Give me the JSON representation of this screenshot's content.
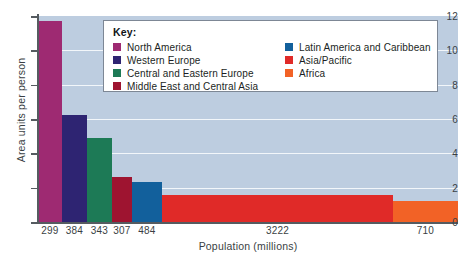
{
  "chart_data": {
    "type": "bar",
    "title": "",
    "xlabel": "Population (millions)",
    "ylabel": "Area units per person",
    "ylim": [
      0,
      12
    ],
    "ytick_values": [
      0,
      2,
      4,
      6,
      8,
      10,
      12
    ],
    "ytick_labels": [
      "0",
      "2",
      "4",
      "6",
      "8",
      "10",
      "12"
    ],
    "grid": true,
    "grid_color": "#f2f6fa",
    "plot_background": "#bdcde0",
    "legend_position": "top-center",
    "note": "Bar widths are proportional to population (millions); bar heights are area units per person.",
    "categories": [
      "North America",
      "Western Europe",
      "Central and Eastern Europe",
      "Middle East and Central Asia",
      "Latin America and Caribbean",
      "Asia/Pacific",
      "Africa"
    ],
    "x_tick_labels": [
      "299",
      "384",
      "343",
      "307",
      "484",
      "3222",
      "710"
    ],
    "populations": [
      299,
      384,
      343,
      307,
      484,
      3222,
      710
    ],
    "values": [
      11.7,
      6.25,
      4.9,
      2.65,
      2.35,
      1.6,
      1.2
    ],
    "colors": [
      "#9e2a72",
      "#2e2472",
      "#1d7a56",
      "#9e1430",
      "#12609c",
      "#e02a28",
      "#f26226"
    ],
    "bars": [
      {
        "label": "North America",
        "color": "#9e2a72",
        "value": 11.7,
        "population": "299",
        "x": 38,
        "width": 24
      },
      {
        "label": "Western Europe",
        "color": "#2e2472",
        "value": 6.25,
        "population": "384",
        "x": 62,
        "width": 25
      },
      {
        "label": "Central and Eastern Europe",
        "color": "#1d7a56",
        "value": 4.9,
        "population": "343",
        "x": 87,
        "width": 25
      },
      {
        "label": "Middle East and Central Asia",
        "color": "#9e1430",
        "value": 2.65,
        "population": "307",
        "x": 112,
        "width": 20
      },
      {
        "label": "Latin America and Caribbean",
        "color": "#12609c",
        "value": 2.35,
        "population": "484",
        "x": 132,
        "width": 30
      },
      {
        "label": "Asia/Pacific",
        "color": "#e02a28",
        "value": 1.6,
        "population": "3222",
        "x": 162,
        "width": 231
      },
      {
        "label": "Africa",
        "color": "#f26226",
        "value": 1.2,
        "population": "710",
        "x": 393,
        "width": 65
      }
    ]
  },
  "legend": {
    "title": "Key:",
    "left_column": [
      {
        "label": "North America",
        "color": "#9e2a72"
      },
      {
        "label": "Western Europe",
        "color": "#2e2472"
      },
      {
        "label": "Central and Eastern Europe",
        "color": "#1d7a56"
      },
      {
        "label": "Middle East and Central Asia",
        "color": "#9e1430"
      }
    ],
    "right_column": [
      {
        "label": "Latin America and Caribbean",
        "color": "#12609c"
      },
      {
        "label": "Asia/Pacific",
        "color": "#e02a28"
      },
      {
        "label": "Africa",
        "color": "#f26226"
      }
    ]
  }
}
